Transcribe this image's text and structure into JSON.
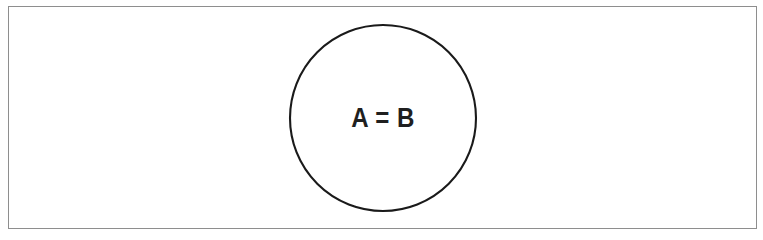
{
  "figure": {
    "type": "venn-diagram",
    "caption_text": "A = B",
    "background_color": "#ffffff"
  },
  "frame": {
    "name": "figure-border",
    "border_color": "#8e8e8e",
    "border_width_px": 1,
    "x": 8,
    "y": 6,
    "width": 749,
    "height": 223
  },
  "diagram": {
    "circles": [
      {
        "id": "set-a-b",
        "label": "A = B",
        "center_x": 383,
        "center_y": 118,
        "radius": 93,
        "stroke_color": "#1a1a1a",
        "fill_color": "#ffffff",
        "stroke_width_px": 2
      }
    ],
    "label": {
      "text": "A = B",
      "color": "#1f1f1f",
      "font_size_px": 28,
      "weight": "bold",
      "center_x": 383,
      "center_y": 118
    }
  }
}
